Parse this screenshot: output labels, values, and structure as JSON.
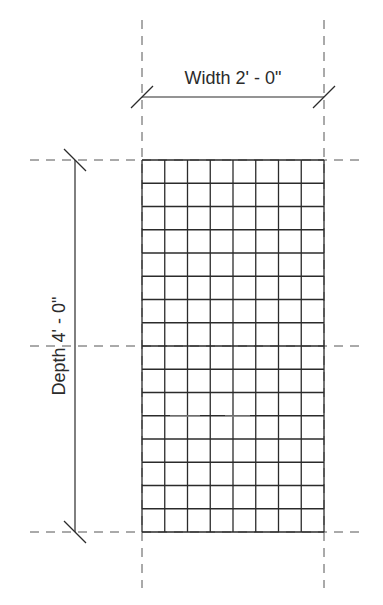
{
  "drawing": {
    "type": "plan-view-dimensioned-panel",
    "width_label": "Width 2' - 0\"",
    "depth_label": "Depth 4' - 0\"",
    "grid": {
      "columns": 8,
      "rows": 16,
      "x0": 142,
      "x1": 324,
      "y0": 160,
      "y1": 532
    },
    "colors": {
      "line": "#2b2b2b",
      "dashed": "#555555",
      "text": "#2b2b2b",
      "background": "#ffffff"
    }
  }
}
